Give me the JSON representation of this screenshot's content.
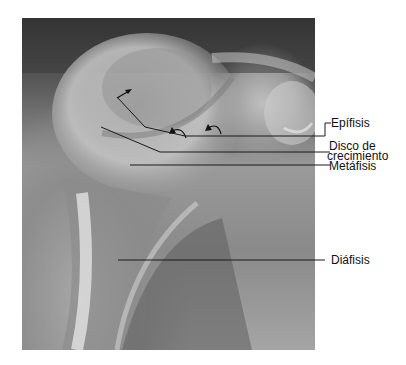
{
  "figure": {
    "type": "radiograph",
    "arrows": [
      {
        "kind": "straight",
        "position": [
          97,
          62
        ]
      },
      {
        "kind": "curved",
        "position": [
          180,
          120
        ]
      },
      {
        "kind": "curved",
        "position": [
          212,
          115
        ]
      }
    ]
  },
  "labels": [
    {
      "id": "epifisis",
      "text": "Epífisis"
    },
    {
      "id": "disco_line1",
      "text": "Disco de"
    },
    {
      "id": "disco_line2",
      "text": "crecimiento"
    },
    {
      "id": "metafisis",
      "text": "Metáfisis"
    },
    {
      "id": "diafisis",
      "text": "Diáfisis"
    }
  ],
  "colors": {
    "leader_line": "#1a1a1a",
    "label_text": "#111111",
    "background": "#ffffff"
  }
}
